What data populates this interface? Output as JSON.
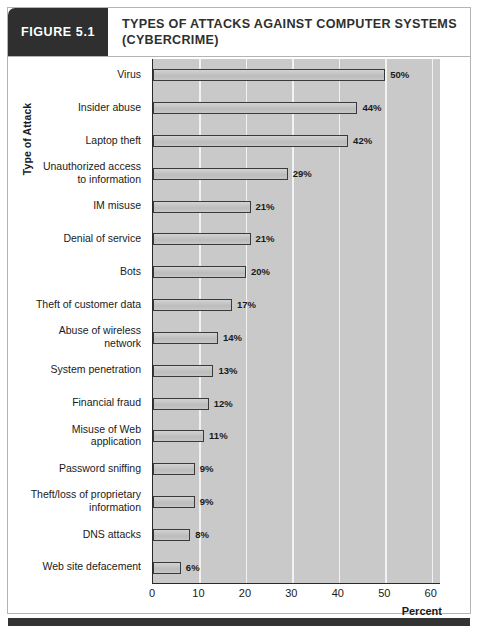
{
  "figure": {
    "tag": "FIGURE 5.1",
    "title_line1": "TYPES OF ATTACKS AGAINST COMPUTER SYSTEMS",
    "title_line2": "(CYBERCRIME)"
  },
  "colors": {
    "header_tag_bg": "#2f2f2f",
    "title_text": "#2f2f2f",
    "plot_bg": "#c9c9c9",
    "gridline": "#f2f2f2",
    "bar_fill": "#c6c6c6",
    "bar_border": "#3a3a3a",
    "axis": "#2a2a2a",
    "bottom_rule": "#333333"
  },
  "chart_data": {
    "type": "bar",
    "orientation": "horizontal",
    "title": "TYPES OF ATTACKS AGAINST COMPUTER SYSTEMS (CYBERCRIME)",
    "xlabel": "Percent",
    "ylabel": "Type of Attack",
    "xlim": [
      0,
      62
    ],
    "xticks": [
      0,
      10,
      20,
      30,
      40,
      50,
      60
    ],
    "xtick_labels": [
      "0",
      "10",
      "20",
      "30",
      "40",
      "50",
      "60"
    ],
    "grid": "vertical",
    "legend": null,
    "value_suffix": "%",
    "categories": [
      "Virus",
      "Insider abuse",
      "Laptop theft",
      "Unauthorized access to information",
      "IM misuse",
      "Denial of service",
      "Bots",
      "Theft of customer data",
      "Abuse of wireless network",
      "System penetration",
      "Financial fraud",
      "Misuse of Web application",
      "Password sniffing",
      "Theft/loss of proprietary information",
      "DNS attacks",
      "Web site defacement"
    ],
    "values": [
      50,
      44,
      42,
      29,
      21,
      21,
      20,
      17,
      14,
      13,
      12,
      11,
      9,
      9,
      8,
      6
    ],
    "data_labels": [
      "50%",
      "44%",
      "42%",
      "29%",
      "21%",
      "21%",
      "20%",
      "17%",
      "14%",
      "13%",
      "12%",
      "11%",
      "9%",
      "9%",
      "8%",
      "6%"
    ],
    "category_label_lines": [
      [
        "Virus"
      ],
      [
        "Insider abuse"
      ],
      [
        "Laptop theft"
      ],
      [
        "Unauthorized access",
        "to information"
      ],
      [
        "IM misuse"
      ],
      [
        "Denial of service"
      ],
      [
        "Bots"
      ],
      [
        "Theft of customer data"
      ],
      [
        "Abuse of wireless",
        "network"
      ],
      [
        "System penetration"
      ],
      [
        "Financial fraud"
      ],
      [
        "Misuse of Web",
        "application"
      ],
      [
        "Password sniffing"
      ],
      [
        "Theft/loss of proprietary",
        "information"
      ],
      [
        "DNS attacks"
      ],
      [
        "Web site defacement"
      ]
    ]
  }
}
